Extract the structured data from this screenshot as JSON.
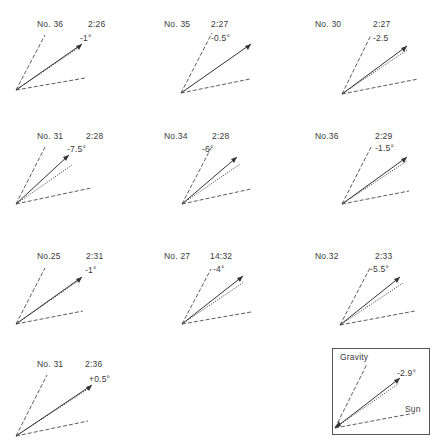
{
  "figure": {
    "panels": [
      {
        "id": "No. 36",
        "time": "2:26",
        "angle": "-1°"
      },
      {
        "id": "No. 35",
        "time": "2:27",
        "angle": "-0.5°"
      },
      {
        "id": "No. 30",
        "time": "2:27",
        "angle": "-2.5"
      },
      {
        "id": "No. 31",
        "time": "2:28",
        "angle": "-7.5°"
      },
      {
        "id": "No.34",
        "time": "2:28",
        "angle": "-6°"
      },
      {
        "id": "No.36",
        "time": "2:29",
        "angle": "-1.5°"
      },
      {
        "id": "No.25",
        "time": "2:31",
        "angle": "-1°"
      },
      {
        "id": "No. 27",
        "time": "14:32",
        "angle": "-4°"
      },
      {
        "id": "No.32",
        "time": "2:33",
        "angle": "-5.5°"
      },
      {
        "id": "No. 31",
        "time": "2:36",
        "angle": "+0.5°"
      }
    ],
    "legend": {
      "gravity_label": "Gravity",
      "sun_label": "Sun",
      "angle": "-2.9°"
    }
  },
  "colors": {
    "line": "#333333",
    "background": "#ffffff"
  }
}
